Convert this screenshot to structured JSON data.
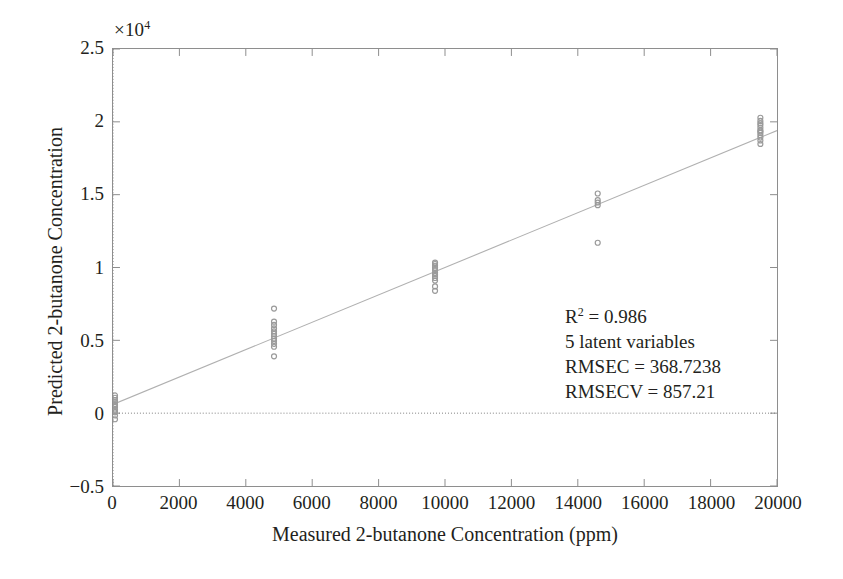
{
  "chart_data": {
    "type": "scatter",
    "title": "",
    "xlabel": "Measured 2-butanone Concentration (ppm)",
    "ylabel": "Predicted 2-butanone Concentration",
    "y_multiplier": "×10",
    "y_multiplier_exp": "4",
    "xlim": [
      0,
      20000
    ],
    "ylim": [
      -5000,
      25000
    ],
    "xticks": [
      0,
      2000,
      4000,
      6000,
      8000,
      10000,
      12000,
      14000,
      16000,
      18000,
      20000
    ],
    "xtick_labels": [
      "0",
      "2000",
      "4000",
      "6000",
      "8000",
      "10000",
      "12000",
      "14000",
      "16000",
      "18000",
      "20000"
    ],
    "yticks": [
      -5000,
      0,
      5000,
      10000,
      15000,
      20000,
      25000
    ],
    "ytick_labels": [
      "−0.5",
      "0",
      "0.5",
      "1",
      "1.5",
      "2",
      "2.5"
    ],
    "grid": false,
    "legend": "none",
    "marker": {
      "shape": "circle-open",
      "color": "#9a9a9a",
      "size": 5
    },
    "reference_lines": [
      {
        "name": "zero-horizontal",
        "orientation": "horizontal",
        "value": 0,
        "style": "dotted"
      },
      {
        "name": "zero-vertical",
        "orientation": "vertical",
        "value": 0,
        "style": "dotted"
      }
    ],
    "fit_line": {
      "name": "regression-line",
      "style": "solid",
      "color": "#b0b0b0",
      "x_start": 0,
      "y_start": 600,
      "x_end": 20000,
      "y_end": 19400
    },
    "series": [
      {
        "name": "Calibration samples",
        "color": "#9a9a9a",
        "points": [
          [
            60,
            -420
          ],
          [
            60,
            -160
          ],
          [
            60,
            60
          ],
          [
            60,
            250
          ],
          [
            60,
            430
          ],
          [
            60,
            620
          ],
          [
            60,
            760
          ],
          [
            60,
            900
          ],
          [
            60,
            1060
          ],
          [
            60,
            1220
          ],
          [
            60,
            150
          ],
          [
            60,
            520
          ],
          [
            4850,
            3900
          ],
          [
            4850,
            4560
          ],
          [
            4850,
            4760
          ],
          [
            4850,
            4960
          ],
          [
            4850,
            5120
          ],
          [
            4850,
            5280
          ],
          [
            4850,
            5440
          ],
          [
            4850,
            5620
          ],
          [
            4850,
            5820
          ],
          [
            4850,
            6060
          ],
          [
            4850,
            6280
          ],
          [
            4850,
            7180
          ],
          [
            9700,
            8400
          ],
          [
            9700,
            8700
          ],
          [
            9700,
            9100
          ],
          [
            9700,
            9420
          ],
          [
            9700,
            9640
          ],
          [
            9700,
            9820
          ],
          [
            9700,
            9980
          ],
          [
            9700,
            10120
          ],
          [
            9700,
            10240
          ],
          [
            9700,
            10340
          ],
          [
            9700,
            9280
          ],
          [
            9700,
            9540
          ],
          [
            14600,
            11700
          ],
          [
            14600,
            14280
          ],
          [
            14600,
            14460
          ],
          [
            14600,
            14620
          ],
          [
            14600,
            15080
          ],
          [
            19500,
            18480
          ],
          [
            19500,
            18720
          ],
          [
            19500,
            18920
          ],
          [
            19500,
            19080
          ],
          [
            19500,
            19240
          ],
          [
            19500,
            19420
          ],
          [
            19500,
            19600
          ],
          [
            19500,
            19780
          ],
          [
            19500,
            20060
          ],
          [
            19500,
            20280
          ],
          [
            19500,
            19340
          ],
          [
            19500,
            19900
          ]
        ]
      }
    ],
    "annotation": {
      "r_squared_prefix": "R",
      "r_squared_exp": "2",
      "r_squared_value": " = 0.986",
      "latent_variables": "5 latent variables",
      "rmsec": "RMSEC = 368.7238",
      "rmsecv": "RMSECV = 857.21"
    }
  }
}
